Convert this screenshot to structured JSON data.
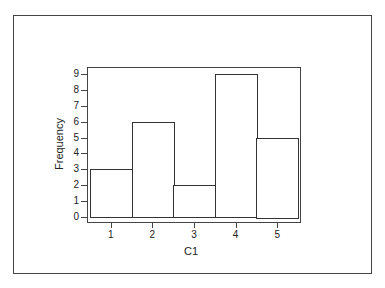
{
  "chart_data": {
    "type": "bar",
    "title": "",
    "xlabel": "C1",
    "ylabel": "Frequency",
    "categories": [
      "1",
      "2",
      "3",
      "4",
      "5"
    ],
    "values": [
      3,
      6,
      2,
      9,
      5
    ],
    "y_ticks": [
      "0",
      "1",
      "2",
      "3",
      "4",
      "5",
      "6",
      "7",
      "8",
      "9"
    ],
    "ylim": [
      0,
      9
    ],
    "grid": false,
    "legend": null,
    "style": "histogram"
  }
}
